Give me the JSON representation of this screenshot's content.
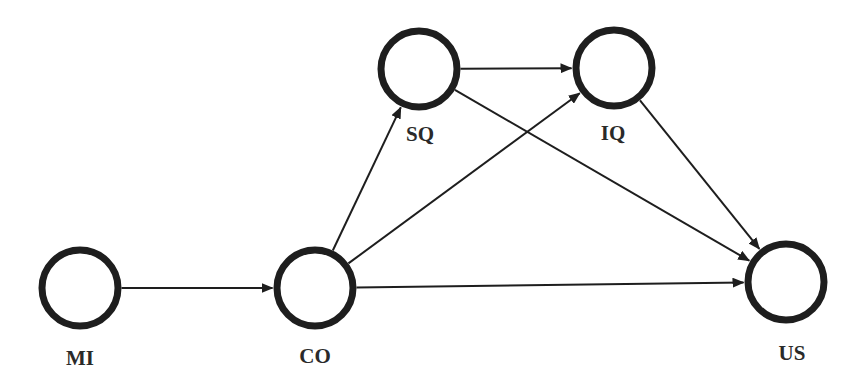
{
  "diagram": {
    "type": "path-model",
    "colors": {
      "stroke": "#1e1e1e",
      "text": "#2a2a2a",
      "background": "#ffffff"
    },
    "nodes": [
      {
        "id": "MI",
        "label": "MI",
        "cx": 80,
        "cy": 288,
        "r": 38,
        "lx": 80,
        "ly": 365
      },
      {
        "id": "CO",
        "label": "CO",
        "cx": 315,
        "cy": 288,
        "r": 38,
        "lx": 315,
        "ly": 363
      },
      {
        "id": "SQ",
        "label": "SQ",
        "cx": 419,
        "cy": 69,
        "r": 38,
        "lx": 420,
        "ly": 141
      },
      {
        "id": "IQ",
        "label": "IQ",
        "cx": 614,
        "cy": 68,
        "r": 38,
        "lx": 613,
        "ly": 140
      },
      {
        "id": "US",
        "label": "US",
        "cx": 786,
        "cy": 282,
        "r": 38,
        "lx": 792,
        "ly": 360
      }
    ],
    "edges": [
      {
        "from": "MI",
        "to": "CO"
      },
      {
        "from": "CO",
        "to": "SQ"
      },
      {
        "from": "CO",
        "to": "IQ"
      },
      {
        "from": "CO",
        "to": "US"
      },
      {
        "from": "SQ",
        "to": "IQ"
      },
      {
        "from": "SQ",
        "to": "US"
      },
      {
        "from": "IQ",
        "to": "US"
      }
    ]
  }
}
